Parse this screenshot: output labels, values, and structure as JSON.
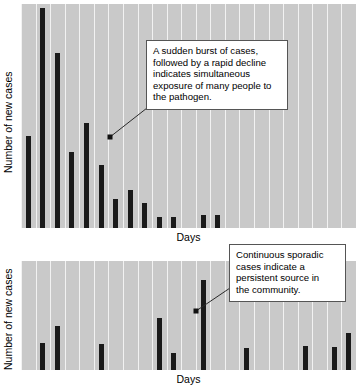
{
  "figure": {
    "background": "#ffffff",
    "plot_background": "#c9c9c9",
    "bar_color": "#1a1a1a",
    "gridline_color": "#f2f2f2"
  },
  "charts": [
    {
      "id": "point-source-outbreak",
      "ylabel": "Number of new cases",
      "xlabel": "Days",
      "callout": {
        "text": "A sudden burst of cases, followed by a rapid decline indicates simultaneous exposure of many people to the pathogen.",
        "lines": [
          "A sudden burst of cases,",
          "followed by a rapid decline",
          "indicates simultaneous",
          "exposure of many people to",
          "the pathogen."
        ]
      }
    },
    {
      "id": "continuous-source-outbreak",
      "ylabel": "Number of new cases",
      "xlabel": "Days",
      "callout": {
        "text": "Continuous sporadic cases indicate a persistent source in the community.",
        "lines": [
          "Continuous sporadic",
          "cases indicate a",
          "persistent source in",
          "the community."
        ]
      }
    }
  ],
  "chart_data": [
    {
      "type": "bar",
      "id": "point-source-outbreak",
      "title": "",
      "xlabel": "Days",
      "ylabel": "Number of new cases",
      "grid": "vertical-only",
      "legend": "none",
      "ylim": [
        0,
        100
      ],
      "x": [
        1,
        2,
        3,
        4,
        5,
        6,
        7,
        8,
        9,
        10,
        11,
        12,
        13,
        14,
        15,
        16,
        17,
        18,
        19,
        20,
        21,
        22,
        23
      ],
      "categories": [
        "1",
        "2",
        "3",
        "4",
        "5",
        "6",
        "7",
        "8",
        "9",
        "10",
        "11",
        "12",
        "13",
        "14",
        "15",
        "16",
        "17",
        "18",
        "19",
        "20",
        "21",
        "22",
        "23"
      ],
      "values": [
        41,
        98,
        78,
        34,
        47,
        28,
        13,
        17,
        11,
        5,
        5,
        0,
        6,
        6,
        0,
        0,
        0,
        0,
        0,
        0,
        0,
        0,
        0
      ],
      "annotations": [
        {
          "text": "A sudden burst of cases, followed by a rapid decline indicates simultaneous exposure of many people to the pathogen.",
          "anchor_x": 7.2,
          "anchor_y": 46
        }
      ]
    },
    {
      "type": "bar",
      "id": "continuous-source-outbreak",
      "title": "",
      "xlabel": "Days",
      "ylabel": "Number of new cases",
      "grid": "vertical-only",
      "legend": "none",
      "ylim": [
        0,
        100
      ],
      "x": [
        1,
        2,
        3,
        4,
        5,
        6,
        7,
        8,
        9,
        10,
        11,
        12,
        13,
        14,
        15,
        16,
        17,
        18,
        19,
        20,
        21,
        22,
        23
      ],
      "categories": [
        "1",
        "2",
        "3",
        "4",
        "5",
        "6",
        "7",
        "8",
        "9",
        "10",
        "11",
        "12",
        "13",
        "14",
        "15",
        "16",
        "17",
        "18",
        "19",
        "20",
        "21",
        "22",
        "23"
      ],
      "values": [
        0,
        25,
        40,
        0,
        0,
        24,
        0,
        0,
        0,
        48,
        16,
        0,
        83,
        0,
        0,
        20,
        0,
        0,
        0,
        22,
        0,
        21,
        34
      ],
      "annotations": [
        {
          "text": "Continuous sporadic cases indicate a persistent source in the community.",
          "anchor_x": 13.9,
          "anchor_y": 62
        }
      ]
    }
  ]
}
